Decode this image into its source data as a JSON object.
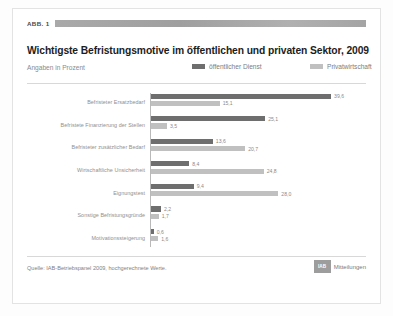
{
  "figure": {
    "number_label": "ABB. 1",
    "redacted_bar": true
  },
  "header": {
    "title": "Wichtigste Befristungsmotive im öffentlichen und privaten Sektor, 2009",
    "units": "Angaben in Prozent"
  },
  "colors": {
    "series_public": "#6e6e6e",
    "series_private": "#c0c0c0",
    "axis": "#b9b9b9",
    "rule": "#d8d8d8",
    "title_text": "#1d1d1d",
    "label_text": "#8f8f8f"
  },
  "footer": {
    "source": "Quelle: IAB-Betriebspanel 2009, hochgerechnete Werte.",
    "brand_mark": "IAB",
    "brand_text": "Mitteilungen"
  },
  "chart_data": {
    "type": "bar",
    "orientation": "horizontal",
    "title": "Wichtigste Befristungsmotive im öffentlichen und privaten Sektor, 2009",
    "subtitle": "Angaben in Prozent",
    "xlabel": "",
    "ylabel": "",
    "xlim": [
      0,
      42
    ],
    "grid": false,
    "legend_position": "top-right",
    "categories": [
      "Befristeter Ersatzbedarf",
      "Befristete Finanzierung der Stellen",
      "Befristeter zusätzlicher Bedarf",
      "Wirtschaftliche Unsicherheit",
      "Eignungstest",
      "Sonstige Befristungsgründe",
      "Motivationssteigerung"
    ],
    "series": [
      {
        "name": "öffentlicher Dienst",
        "color": "#6e6e6e",
        "values": [
          39.6,
          25.1,
          13.6,
          8.4,
          9.4,
          2.2,
          0.6
        ],
        "labels": [
          "39,6",
          "25,1",
          "13,6",
          "8,4",
          "9,4",
          "2,2",
          "0,6"
        ]
      },
      {
        "name": "Privatwirtschaft",
        "color": "#c0c0c0",
        "values": [
          15.1,
          3.5,
          20.7,
          24.8,
          28.0,
          1.7,
          1.6
        ],
        "labels": [
          "15,1",
          "3,5",
          "20,7",
          "24,8",
          "28,0",
          "1,7",
          "1,6"
        ]
      }
    ]
  }
}
